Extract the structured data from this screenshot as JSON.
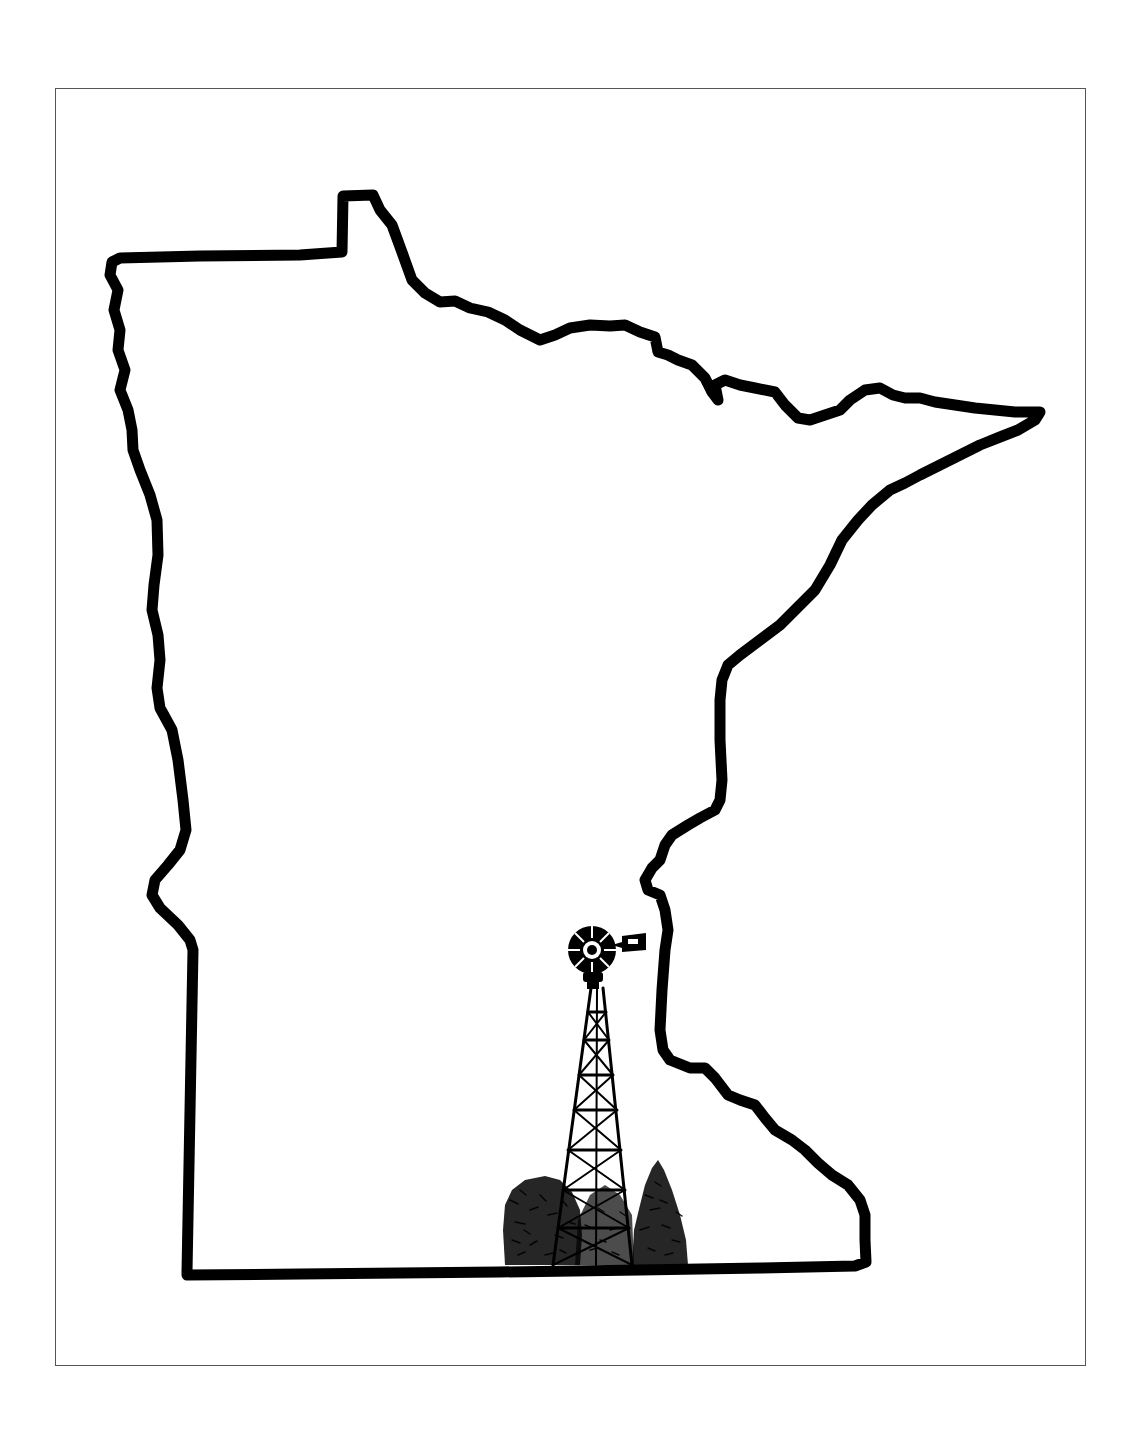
{
  "illustration": {
    "subject": "minnesota-state-outline",
    "contents": [
      "state-outline",
      "windmill",
      "trees"
    ]
  },
  "colors": {
    "background": "#ffffff",
    "ink": "#000000",
    "frame": "#555555"
  }
}
